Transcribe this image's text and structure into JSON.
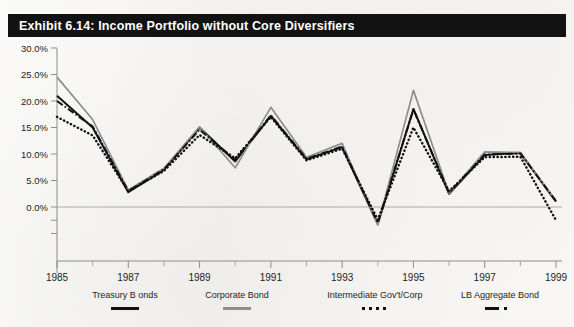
{
  "page": {
    "cut_off_text": "",
    "background_color": "#f4f3f1"
  },
  "title_bar": {
    "text": "Exhibit 6.14: Income Portfolio without Core Diversifiers",
    "background_color": "#121212",
    "text_color": "#ffffff"
  },
  "legend": {
    "items": [
      {
        "label": "Treasury B onds",
        "style": "solid",
        "color": "#111111"
      },
      {
        "label": "Corporate Bond",
        "style": "solid-gray",
        "color": "#8e8e8e"
      },
      {
        "label": "Intermediate Gov't/Corp",
        "style": "dotted",
        "color": "#111111"
      },
      {
        "label": "LB Aggregate Bond",
        "style": "dash-dot",
        "color": "#111111"
      }
    ]
  },
  "chart_data": {
    "type": "line",
    "title": "Exhibit 6.14: Income Portfolio without Core Diversifiers",
    "xlabel": "",
    "ylabel": "",
    "grid": false,
    "zero_line": true,
    "legend_position": "bottom",
    "x": [
      1985,
      1986,
      1987,
      1988,
      1989,
      1990,
      1991,
      1992,
      1993,
      1994,
      1995,
      1996,
      1997,
      1998,
      1999
    ],
    "xlim": [
      1985,
      1999
    ],
    "x_tick_labels": [
      "1985",
      "1987",
      "1989",
      "1991",
      "1993",
      "1995",
      "1997",
      "1999"
    ],
    "x_tick_values": [
      1985,
      1987,
      1989,
      1991,
      1993,
      1995,
      1997,
      1999
    ],
    "x_minor_ticks": [
      1986,
      1988,
      1990,
      1992,
      1994,
      1996,
      1998
    ],
    "ylim": [
      -5.0,
      30.0
    ],
    "y_tick_labels": [
      "30.0%",
      "25.0%",
      "20.0%",
      "15.0%",
      "10.0%",
      "5.0%",
      "0.0%"
    ],
    "y_tick_values": [
      30.0,
      25.0,
      20.0,
      15.0,
      10.0,
      5.0,
      0.0
    ],
    "y_minor_tick_values": [
      -2.5,
      -5.0
    ],
    "series": [
      {
        "name": "Treasury B onds",
        "style": "solid",
        "color": "#111111",
        "values": [
          21.0,
          15.0,
          2.8,
          7.0,
          15.0,
          8.6,
          17.2,
          9.0,
          11.3,
          -3.2,
          18.5,
          2.5,
          9.8,
          10.2,
          1.0
        ]
      },
      {
        "name": "Corporate Bond",
        "style": "solid-gray",
        "color": "#8e8e8e",
        "values": [
          24.5,
          16.5,
          3.2,
          7.3,
          15.1,
          7.4,
          18.8,
          9.4,
          12.0,
          -3.4,
          22.0,
          2.6,
          10.4,
          10.3,
          1.2
        ]
      },
      {
        "name": "Intermediate Gov't/Corp",
        "style": "dotted",
        "color": "#111111",
        "values": [
          17.0,
          13.5,
          3.0,
          6.8,
          13.6,
          9.2,
          17.0,
          8.8,
          11.0,
          -2.4,
          15.0,
          3.0,
          9.4,
          9.5,
          -2.5
        ]
      },
      {
        "name": "LB Aggregate Bond",
        "style": "dash-dot",
        "color": "#111111",
        "values": [
          20.0,
          15.2,
          3.0,
          7.1,
          14.6,
          8.9,
          17.3,
          9.1,
          11.4,
          -3.0,
          18.4,
          2.7,
          9.9,
          10.1,
          1.1
        ]
      }
    ]
  }
}
